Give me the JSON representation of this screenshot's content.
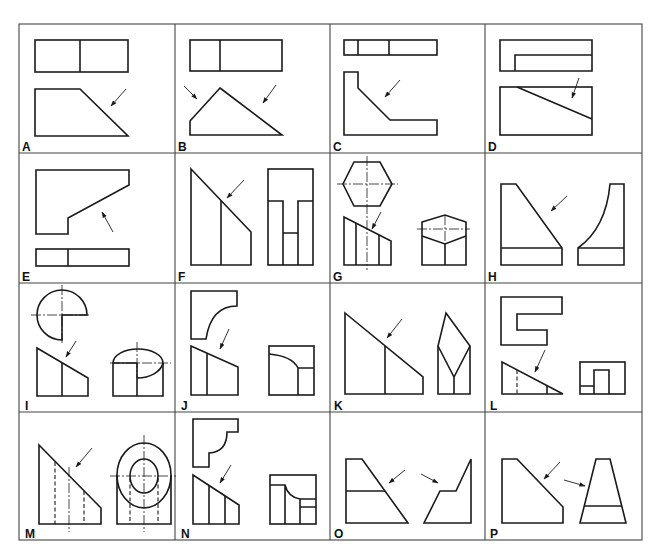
{
  "figure": {
    "grid": {
      "columns": 4,
      "rows": 4
    },
    "panels": [
      {
        "id": "A",
        "label": "A"
      },
      {
        "id": "B",
        "label": "B"
      },
      {
        "id": "C",
        "label": "C"
      },
      {
        "id": "D",
        "label": "D"
      },
      {
        "id": "E",
        "label": "E"
      },
      {
        "id": "F",
        "label": "F"
      },
      {
        "id": "G",
        "label": "G"
      },
      {
        "id": "H",
        "label": "H"
      },
      {
        "id": "I",
        "label": "I"
      },
      {
        "id": "J",
        "label": "J"
      },
      {
        "id": "K",
        "label": "K"
      },
      {
        "id": "L",
        "label": "L"
      },
      {
        "id": "M",
        "label": "M"
      },
      {
        "id": "N",
        "label": "N"
      },
      {
        "id": "O",
        "label": "O"
      },
      {
        "id": "P",
        "label": "P"
      }
    ],
    "colors": {
      "line": "#1a1a1a",
      "background": "#ffffff",
      "border": "#444444"
    }
  }
}
